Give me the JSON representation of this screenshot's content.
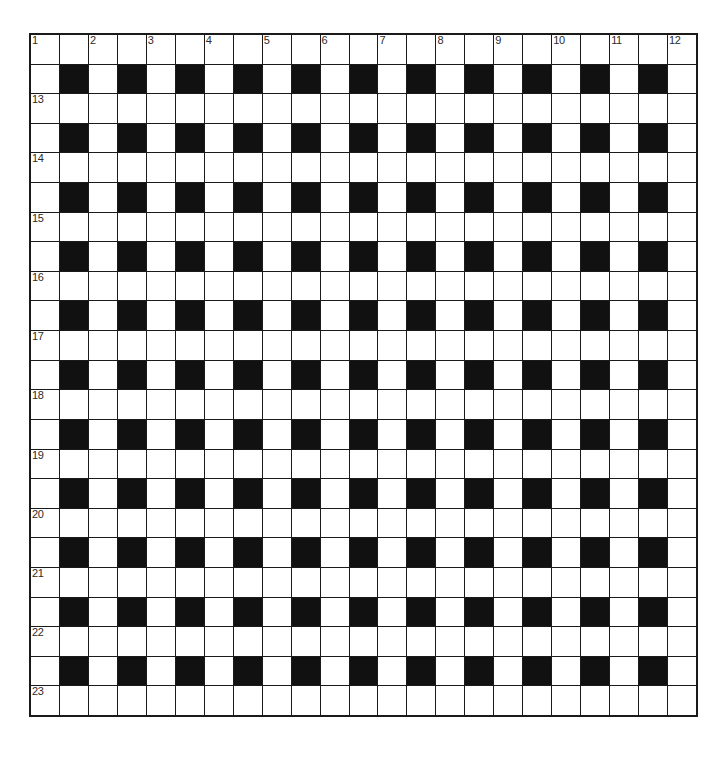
{
  "document": {
    "type": "crossword-puzzle-grid",
    "title": "Crossword Grid"
  },
  "chart_data": {
    "type": "table",
    "rows": 23,
    "columns": 23,
    "cell_size_px": 29,
    "grid_origin": {
      "x": 29,
      "y": 33
    },
    "grid_size": {
      "width": 669,
      "height": 684
    },
    "blocked_rule": "even row and even column (1-indexed) are blocked",
    "colors": {
      "blocked": "#111111",
      "open": "#ffffff",
      "border": "#1a1a1a",
      "number": "#2b2b2b",
      "background": "#ffffff"
    },
    "clue_numbers": {
      "across_top_row": [
        {
          "number": "1",
          "row": 1,
          "col": 1
        },
        {
          "number": "2",
          "row": 1,
          "col": 3
        },
        {
          "number": "3",
          "row": 1,
          "col": 5
        },
        {
          "number": "4",
          "row": 1,
          "col": 7
        },
        {
          "number": "5",
          "row": 1,
          "col": 9
        },
        {
          "number": "6",
          "row": 1,
          "col": 11
        },
        {
          "number": "7",
          "row": 1,
          "col": 13
        },
        {
          "number": "8",
          "row": 1,
          "col": 15
        },
        {
          "number": "9",
          "row": 1,
          "col": 17
        },
        {
          "number": "10",
          "row": 1,
          "col": 19
        },
        {
          "number": "11",
          "row": 1,
          "col": 21
        },
        {
          "number": "12",
          "row": 1,
          "col": 23
        }
      ],
      "down_left_column": [
        {
          "number": "13",
          "row": 3,
          "col": 1
        },
        {
          "number": "14",
          "row": 5,
          "col": 1
        },
        {
          "number": "15",
          "row": 7,
          "col": 1
        },
        {
          "number": "16",
          "row": 9,
          "col": 1
        },
        {
          "number": "17",
          "row": 11,
          "col": 1
        },
        {
          "number": "18",
          "row": 13,
          "col": 1
        },
        {
          "number": "19",
          "row": 15,
          "col": 1
        },
        {
          "number": "20",
          "row": 17,
          "col": 1
        },
        {
          "number": "21",
          "row": 19,
          "col": 1
        },
        {
          "number": "22",
          "row": 21,
          "col": 1
        },
        {
          "number": "23",
          "row": 23,
          "col": 1
        }
      ]
    },
    "numbers_visible": [
      "1",
      "2",
      "3",
      "4",
      "5",
      "6",
      "7",
      "8",
      "9",
      "10",
      "11",
      "12",
      "13",
      "14",
      "15",
      "16",
      "17",
      "18",
      "19",
      "20",
      "21",
      "22",
      "23"
    ]
  }
}
